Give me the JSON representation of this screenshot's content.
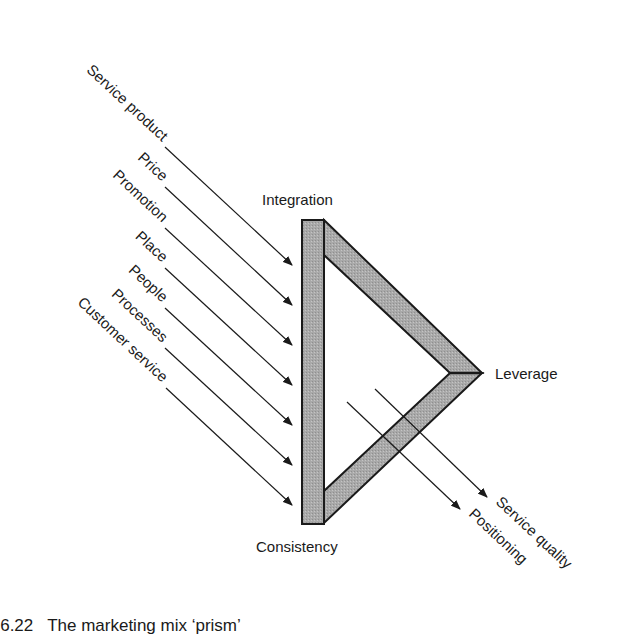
{
  "diagram": {
    "inputs": [
      {
        "label": "Service product"
      },
      {
        "label": "Price"
      },
      {
        "label": "Promotion"
      },
      {
        "label": "Place"
      },
      {
        "label": "People"
      },
      {
        "label": "Processes"
      },
      {
        "label": "Customer service"
      }
    ],
    "vertices": {
      "top": "Integration",
      "right": "Leverage",
      "bottom": "Consistency"
    },
    "outputs": [
      {
        "label": "Service quality"
      },
      {
        "label": "Positioning"
      }
    ],
    "colors": {
      "prism_fill": "#a8a8a8",
      "stroke": "#1a1a1a"
    }
  },
  "caption": {
    "text": "e 6.22   The marketing mix ‘prism’"
  }
}
